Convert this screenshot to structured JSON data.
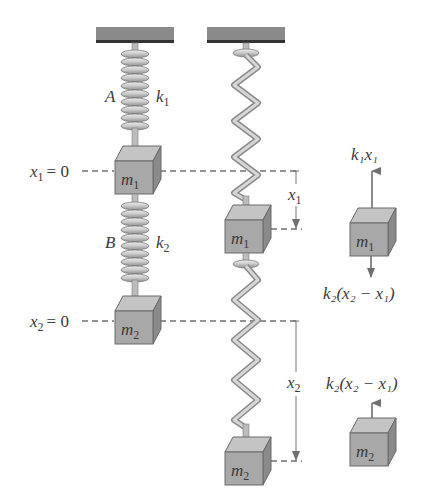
{
  "diagram": {
    "colors": {
      "ceiling": "#8a8a8a",
      "ceiling_edge": "#333333",
      "spring_light": "#d8d8d8",
      "spring_dark": "#8f8f8f",
      "box_front": "#a6a6a6",
      "box_top": "#c2c2c2",
      "box_side": "#8a8a8a",
      "box_edge": "#6a6a6a",
      "dash": "#707070",
      "arrow": "#707070",
      "text": "#3a3a3a"
    },
    "left_system": {
      "spring_a": {
        "label": "A",
        "constant": "k",
        "constant_sub": "1"
      },
      "spring_b": {
        "label": "B",
        "constant": "k",
        "constant_sub": "2"
      },
      "mass_1": {
        "symbol": "m",
        "sub": "1"
      },
      "mass_2": {
        "symbol": "m",
        "sub": "2"
      },
      "ref_1": {
        "var": "x",
        "sub": "1",
        "eq": "= 0"
      },
      "ref_2": {
        "var": "x",
        "sub": "2",
        "eq": "= 0"
      }
    },
    "right_system": {
      "mass_1": {
        "symbol": "m",
        "sub": "1"
      },
      "mass_2": {
        "symbol": "m",
        "sub": "2"
      },
      "disp_1": {
        "var": "x",
        "sub": "1"
      },
      "disp_2": {
        "var": "x",
        "sub": "2"
      }
    },
    "free_body": {
      "m1": {
        "mass": {
          "symbol": "m",
          "sub": "1"
        },
        "up_force": "k₁x₁",
        "down_force": "k₂(x₂ − x₁)"
      },
      "m2": {
        "mass": {
          "symbol": "m",
          "sub": "2"
        },
        "up_force": "k₂(x₂ − x₁)"
      }
    }
  }
}
